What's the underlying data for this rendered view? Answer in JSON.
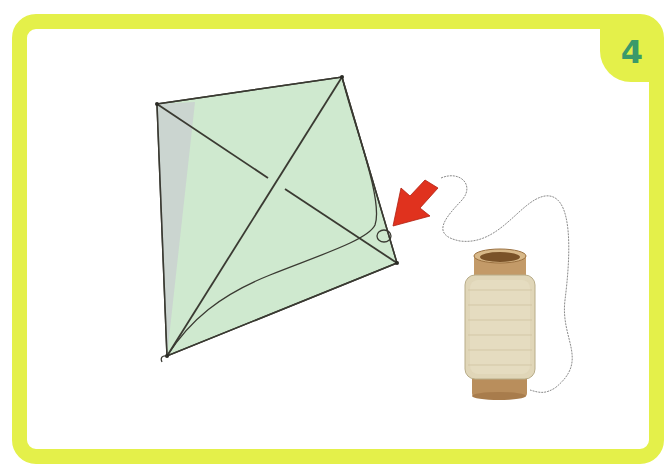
{
  "step": {
    "number": "4"
  },
  "colors": {
    "frame": "#e4f04a",
    "badge_text": "#3a9a6a",
    "kite_fill": "#cfe9cf",
    "kite_shadow": "#c9ccd0",
    "kite_line": "#3a3a32",
    "arrow": "#e0321e",
    "string": "#8a8a8a",
    "spool_body": "#e0d6b8",
    "spool_wood": "#b98e5c"
  },
  "illustration": {
    "description": "Kite with crossed sticks and a string loop tied at the right corner; red arrow points to the loop; spool of string on the right"
  }
}
